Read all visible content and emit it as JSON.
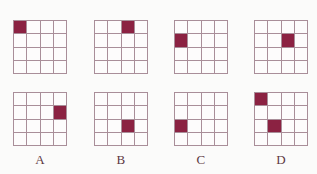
{
  "figure": {
    "type": "multiple-choice-grid-pattern",
    "background_color": "#fbfbfa",
    "grid_line_color": "#a98e99",
    "fill_color": "#8b2242",
    "grid_rows": 4,
    "grid_columns": 4,
    "options": [
      {
        "label": "A",
        "top_grid": {
          "name": "grid-a-top",
          "filled_cells": [
            {
              "row": 1,
              "col": 1
            }
          ],
          "cells": [
            [
              1,
              0,
              0,
              0
            ],
            [
              0,
              0,
              0,
              0
            ],
            [
              0,
              0,
              0,
              0
            ],
            [
              0,
              0,
              0,
              0
            ]
          ]
        },
        "bottom_grid": {
          "name": "grid-a-bottom",
          "filled_cells": [
            {
              "row": 2,
              "col": 4
            }
          ],
          "cells": [
            [
              0,
              0,
              0,
              0
            ],
            [
              0,
              0,
              0,
              1
            ],
            [
              0,
              0,
              0,
              0
            ],
            [
              0,
              0,
              0,
              0
            ]
          ]
        }
      },
      {
        "label": "B",
        "top_grid": {
          "name": "grid-b-top",
          "filled_cells": [
            {
              "row": 1,
              "col": 3
            }
          ],
          "cells": [
            [
              0,
              0,
              1,
              0
            ],
            [
              0,
              0,
              0,
              0
            ],
            [
              0,
              0,
              0,
              0
            ],
            [
              0,
              0,
              0,
              0
            ]
          ]
        },
        "bottom_grid": {
          "name": "grid-b-bottom",
          "filled_cells": [
            {
              "row": 3,
              "col": 3
            }
          ],
          "cells": [
            [
              0,
              0,
              0,
              0
            ],
            [
              0,
              0,
              0,
              0
            ],
            [
              0,
              0,
              1,
              0
            ],
            [
              0,
              0,
              0,
              0
            ]
          ]
        }
      },
      {
        "label": "C",
        "top_grid": {
          "name": "grid-c-top",
          "filled_cells": [
            {
              "row": 2,
              "col": 1
            }
          ],
          "cells": [
            [
              0,
              0,
              0,
              0
            ],
            [
              1,
              0,
              0,
              0
            ],
            [
              0,
              0,
              0,
              0
            ],
            [
              0,
              0,
              0,
              0
            ]
          ]
        },
        "bottom_grid": {
          "name": "grid-c-bottom",
          "filled_cells": [
            {
              "row": 3,
              "col": 1
            }
          ],
          "cells": [
            [
              0,
              0,
              0,
              0
            ],
            [
              0,
              0,
              0,
              0
            ],
            [
              1,
              0,
              0,
              0
            ],
            [
              0,
              0,
              0,
              0
            ]
          ]
        }
      },
      {
        "label": "D",
        "top_grid": {
          "name": "grid-d-top",
          "filled_cells": [
            {
              "row": 2,
              "col": 3
            }
          ],
          "cells": [
            [
              0,
              0,
              0,
              0
            ],
            [
              0,
              0,
              1,
              0
            ],
            [
              0,
              0,
              0,
              0
            ],
            [
              0,
              0,
              0,
              0
            ]
          ]
        },
        "bottom_grid": {
          "name": "grid-d-bottom",
          "filled_cells": [
            {
              "row": 1,
              "col": 1
            },
            {
              "row": 3,
              "col": 2
            }
          ],
          "cells": [
            [
              1,
              0,
              0,
              0
            ],
            [
              0,
              0,
              0,
              0
            ],
            [
              0,
              1,
              0,
              0
            ],
            [
              0,
              0,
              0,
              0
            ]
          ]
        }
      }
    ]
  }
}
